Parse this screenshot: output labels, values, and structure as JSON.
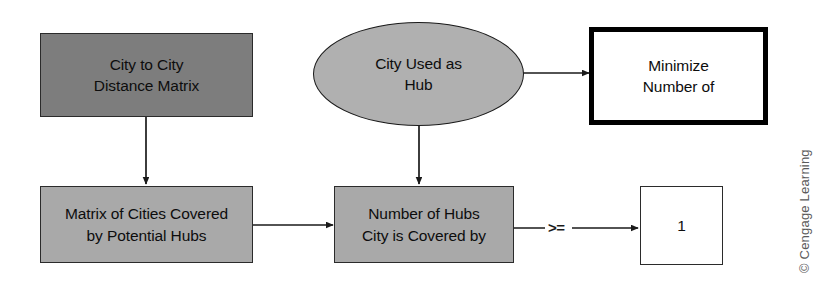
{
  "diagram": {
    "background_color": "#ffffff",
    "nodes": [
      {
        "id": "city-to-city-distance-matrix",
        "label": "City to City\nDistance Matrix",
        "shape": "rectangle",
        "role": "input-data",
        "fill": "#7d7d7d",
        "border": "#2b2b2b"
      },
      {
        "id": "city-used-as-hub",
        "label": "City Used as\nHub",
        "shape": "ellipse",
        "role": "decision-variable",
        "fill": "#b0b0b0",
        "border": "#1a1a1a"
      },
      {
        "id": "minimize-number-of",
        "label": "Minimize\nNumber of",
        "shape": "rectangle-thick",
        "role": "objective",
        "fill": "#ffffff",
        "border": "#000000"
      },
      {
        "id": "matrix-of-cities-covered",
        "label": "Matrix of Cities Covered\nby Potential Hubs",
        "shape": "rectangle",
        "role": "derived-data",
        "fill": "#a9a9a9",
        "border": "#2b2b2b"
      },
      {
        "id": "number-of-hubs-covering-city",
        "label": "Number of Hubs\nCity is Covered by",
        "shape": "rectangle",
        "role": "constraint-lhs",
        "fill": "#a9a9a9",
        "border": "#2b2b2b"
      },
      {
        "id": "constraint-rhs-value",
        "label": "1",
        "shape": "rectangle",
        "role": "constraint-rhs",
        "fill": "#ffffff",
        "border": "#2b2b2b"
      }
    ],
    "edges": [
      {
        "id": "distance-matrix-to-coverage-matrix",
        "from": "city-to-city-distance-matrix",
        "to": "matrix-of-cities-covered",
        "label": "",
        "direction": "down"
      },
      {
        "id": "hub-to-objective",
        "from": "city-used-as-hub",
        "to": "minimize-number-of",
        "label": "",
        "direction": "right"
      },
      {
        "id": "hub-to-number-of-hubs",
        "from": "city-used-as-hub",
        "to": "number-of-hubs-covering-city",
        "label": "",
        "direction": "down"
      },
      {
        "id": "coverage-matrix-to-number-of-hubs",
        "from": "matrix-of-cities-covered",
        "to": "number-of-hubs-covering-city",
        "label": "",
        "direction": "right"
      },
      {
        "id": "number-of-hubs-to-rhs",
        "from": "number-of-hubs-covering-city",
        "to": "constraint-rhs-value",
        "label": ">=",
        "direction": "right"
      }
    ]
  },
  "attribution": {
    "text": "© Cengage Learning"
  }
}
